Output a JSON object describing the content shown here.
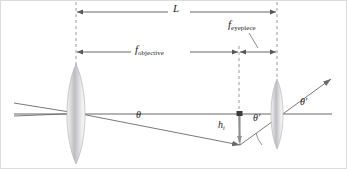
{
  "figure": {
    "background_color": "#ffffff",
    "line_color": "#58585a",
    "dash_color": "#8d8d90",
    "lens_color": "#c9c9cc",
    "text_color": "#222222",
    "border_color": "#d7d7d7",
    "width": 347,
    "height": 169
  },
  "labels": {
    "tube_length": "L",
    "focal_eyepiece_symbol": "f",
    "focal_eyepiece_subscript": "eyepiece",
    "focal_objective_symbol": "f",
    "focal_objective_subscript": "objective",
    "angle_object": "θ",
    "image_height_symbol": "h",
    "image_height_subscript": "i",
    "angle_image_near": "θ′",
    "angle_image_far": "θ′"
  },
  "elements": {
    "objective_lens": "objective-lens",
    "eyepiece_lens": "eyepiece-lens",
    "optical_axis": "optical-axis",
    "incoming_ray": "incoming-ray",
    "refracted_ray": "refracted-ray",
    "exit_ray": "exit-ray",
    "image_arrow": "intermediate-image-arrow"
  },
  "geometry": {
    "objective_x": 76,
    "image_plane_x": 239,
    "eyepiece_x": 277,
    "axis_y": 114,
    "image_tip_y": 145,
    "dim_L_y": 12,
    "dim_f_y": 52
  }
}
